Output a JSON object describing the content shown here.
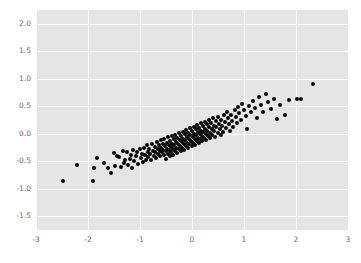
{
  "chart_data": {
    "type": "scatter",
    "title": "",
    "xlabel": "",
    "ylabel": "",
    "xlim": [
      -3,
      3
    ],
    "ylim": [
      -1.75,
      2.25
    ],
    "xticks": [
      -3,
      -2,
      -1,
      0,
      1,
      2,
      3
    ],
    "xticklabels": [
      "-3",
      "-2",
      "-1",
      "0",
      "1",
      "2",
      "3"
    ],
    "yticks": [
      2.0,
      1.5,
      1.0,
      0.5,
      0.0,
      -0.5,
      -1.0,
      -1.5
    ],
    "yticklabels": [
      "2.0",
      "1.5",
      "1.0",
      "0.5",
      "0.0",
      "-0.5",
      "-1.0",
      "-1.5"
    ],
    "grid": true,
    "grid_color": "#ffffff",
    "plot_background": "#e5e5e5",
    "figure_background": "#ffffff",
    "tick_label_color": "#6e6e6e",
    "marker_color": "#0a0a0a",
    "marker_size_px": 4,
    "legend": null,
    "n_points": 201,
    "points": [
      [
        -2.49,
        -0.86
      ],
      [
        -2.22,
        -0.57
      ],
      [
        -1.91,
        -0.86
      ],
      [
        -1.88,
        -0.62
      ],
      [
        -1.82,
        -0.44
      ],
      [
        -1.7,
        -0.54
      ],
      [
        -1.62,
        -0.62
      ],
      [
        -1.55,
        -0.72
      ],
      [
        -1.51,
        -0.35
      ],
      [
        -1.49,
        -0.58
      ],
      [
        -1.44,
        -0.41
      ],
      [
        -1.4,
        -0.43
      ],
      [
        -1.37,
        -0.6
      ],
      [
        -1.33,
        -0.31
      ],
      [
        -1.31,
        -0.53
      ],
      [
        -1.28,
        -0.48
      ],
      [
        -1.25,
        -0.34
      ],
      [
        -1.23,
        -0.57
      ],
      [
        -1.2,
        -0.45
      ],
      [
        -1.18,
        -0.38
      ],
      [
        -1.15,
        -0.62
      ],
      [
        -1.13,
        -0.3
      ],
      [
        -1.11,
        -0.5
      ],
      [
        -1.08,
        -0.41
      ],
      [
        -1.05,
        -0.33
      ],
      [
        -1.03,
        -0.55
      ],
      [
        -1.01,
        -0.28
      ],
      [
        -0.99,
        -0.44
      ],
      [
        -0.97,
        -0.36
      ],
      [
        -0.95,
        -0.52
      ],
      [
        -0.93,
        -0.25
      ],
      [
        -0.91,
        -0.39
      ],
      [
        -0.89,
        -0.47
      ],
      [
        -0.87,
        -0.21
      ],
      [
        -0.85,
        -0.34
      ],
      [
        -0.84,
        -0.43
      ],
      [
        -0.82,
        -0.27
      ],
      [
        -0.8,
        -0.36
      ],
      [
        -0.78,
        -0.48
      ],
      [
        -0.77,
        -0.18
      ],
      [
        -0.75,
        -0.31
      ],
      [
        -0.74,
        -0.4
      ],
      [
        -0.72,
        -0.24
      ],
      [
        -0.71,
        -0.34
      ],
      [
        -0.69,
        -0.44
      ],
      [
        -0.68,
        -0.15
      ],
      [
        -0.66,
        -0.28
      ],
      [
        -0.65,
        -0.37
      ],
      [
        -0.64,
        -0.21
      ],
      [
        -0.62,
        -0.31
      ],
      [
        -0.61,
        -0.41
      ],
      [
        -0.6,
        -0.12
      ],
      [
        -0.59,
        -0.25
      ],
      [
        -0.58,
        -0.34
      ],
      [
        -0.56,
        -0.19
      ],
      [
        -0.55,
        -0.29
      ],
      [
        -0.54,
        -0.38
      ],
      [
        -0.53,
        -0.09
      ],
      [
        -0.52,
        -0.22
      ],
      [
        -0.51,
        -0.32
      ],
      [
        -0.5,
        -0.45
      ],
      [
        -0.49,
        -0.16
      ],
      [
        -0.48,
        -0.27
      ],
      [
        -0.47,
        -0.36
      ],
      [
        -0.46,
        -0.06
      ],
      [
        -0.45,
        -0.2
      ],
      [
        -0.44,
        -0.3
      ],
      [
        -0.43,
        -0.41
      ],
      [
        -0.42,
        -0.13
      ],
      [
        -0.41,
        -0.24
      ],
      [
        -0.4,
        -0.33
      ],
      [
        -0.39,
        -0.04
      ],
      [
        -0.38,
        -0.18
      ],
      [
        -0.37,
        -0.28
      ],
      [
        -0.36,
        -0.38
      ],
      [
        -0.35,
        -0.1
      ],
      [
        -0.34,
        -0.21
      ],
      [
        -0.33,
        -0.31
      ],
      [
        -0.32,
        -0.02
      ],
      [
        -0.31,
        -0.15
      ],
      [
        -0.3,
        -0.25
      ],
      [
        -0.29,
        -0.35
      ],
      [
        -0.28,
        -0.07
      ],
      [
        -0.27,
        -0.18
      ],
      [
        -0.26,
        -0.28
      ],
      [
        -0.25,
        0.01
      ],
      [
        -0.24,
        -0.12
      ],
      [
        -0.23,
        -0.22
      ],
      [
        -0.22,
        -0.32
      ],
      [
        -0.21,
        -0.04
      ],
      [
        -0.2,
        -0.15
      ],
      [
        -0.19,
        -0.25
      ],
      [
        -0.18,
        0.04
      ],
      [
        -0.17,
        -0.09
      ],
      [
        -0.16,
        -0.19
      ],
      [
        -0.15,
        -0.29
      ],
      [
        -0.14,
        -0.01
      ],
      [
        -0.13,
        -0.12
      ],
      [
        -0.12,
        -0.22
      ],
      [
        -0.11,
        0.07
      ],
      [
        -0.1,
        -0.06
      ],
      [
        -0.09,
        -0.16
      ],
      [
        -0.08,
        -0.26
      ],
      [
        -0.07,
        0.02
      ],
      [
        -0.06,
        -0.09
      ],
      [
        -0.05,
        -0.19
      ],
      [
        -0.04,
        0.1
      ],
      [
        -0.03,
        -0.03
      ],
      [
        -0.02,
        -0.13
      ],
      [
        -0.01,
        -0.23
      ],
      [
        0.0,
        0.05
      ],
      [
        0.01,
        -0.06
      ],
      [
        0.02,
        -0.16
      ],
      [
        0.03,
        0.13
      ],
      [
        0.04,
        0.0
      ],
      [
        0.05,
        -0.1
      ],
      [
        0.06,
        -0.2
      ],
      [
        0.07,
        0.08
      ],
      [
        0.08,
        -0.03
      ],
      [
        0.09,
        -0.13
      ],
      [
        0.1,
        0.16
      ],
      [
        0.11,
        0.03
      ],
      [
        0.12,
        -0.07
      ],
      [
        0.13,
        -0.17
      ],
      [
        0.14,
        0.11
      ],
      [
        0.15,
        0.0
      ],
      [
        0.16,
        -0.1
      ],
      [
        0.17,
        0.19
      ],
      [
        0.18,
        0.06
      ],
      [
        0.19,
        -0.04
      ],
      [
        0.2,
        -0.14
      ],
      [
        0.21,
        0.14
      ],
      [
        0.22,
        0.03
      ],
      [
        0.23,
        -0.07
      ],
      [
        0.24,
        0.22
      ],
      [
        0.25,
        0.09
      ],
      [
        0.26,
        -0.01
      ],
      [
        0.27,
        -0.11
      ],
      [
        0.28,
        0.17
      ],
      [
        0.29,
        0.06
      ],
      [
        0.3,
        -0.04
      ],
      [
        0.32,
        0.25
      ],
      [
        0.33,
        0.12
      ],
      [
        0.34,
        0.02
      ],
      [
        0.35,
        -0.08
      ],
      [
        0.37,
        0.2
      ],
      [
        0.38,
        0.09
      ],
      [
        0.39,
        -0.02
      ],
      [
        0.41,
        0.28
      ],
      [
        0.42,
        0.15
      ],
      [
        0.43,
        0.05
      ],
      [
        0.45,
        -0.05
      ],
      [
        0.46,
        0.23
      ],
      [
        0.47,
        0.12
      ],
      [
        0.49,
        0.01
      ],
      [
        0.5,
        0.31
      ],
      [
        0.52,
        0.18
      ],
      [
        0.53,
        0.08
      ],
      [
        0.55,
        -0.02
      ],
      [
        0.56,
        0.26
      ],
      [
        0.58,
        0.15
      ],
      [
        0.6,
        0.04
      ],
      [
        0.62,
        0.34
      ],
      [
        0.63,
        0.21
      ],
      [
        0.65,
        0.11
      ],
      [
        0.67,
        0.4
      ],
      [
        0.69,
        0.28
      ],
      [
        0.71,
        0.17
      ],
      [
        0.73,
        0.06
      ],
      [
        0.75,
        0.35
      ],
      [
        0.77,
        0.24
      ],
      [
        0.79,
        0.13
      ],
      [
        0.82,
        0.43
      ],
      [
        0.84,
        0.31
      ],
      [
        0.86,
        0.2
      ],
      [
        0.89,
        0.48
      ],
      [
        0.91,
        0.37
      ],
      [
        0.94,
        0.26
      ],
      [
        0.97,
        0.55
      ],
      [
        1.0,
        0.43
      ],
      [
        1.03,
        0.32
      ],
      [
        1.06,
        0.09
      ],
      [
        1.09,
        0.5
      ],
      [
        1.13,
        0.39
      ],
      [
        1.17,
        0.6
      ],
      [
        1.21,
        0.47
      ],
      [
        1.25,
        0.28
      ],
      [
        1.29,
        0.66
      ],
      [
        1.33,
        0.52
      ],
      [
        1.37,
        0.4
      ],
      [
        1.42,
        0.73
      ],
      [
        1.46,
        0.58
      ],
      [
        1.51,
        0.45
      ],
      [
        1.57,
        0.64
      ],
      [
        1.63,
        0.27
      ],
      [
        1.7,
        0.52
      ],
      [
        1.78,
        0.34
      ],
      [
        1.86,
        0.62
      ],
      [
        2.02,
        0.63
      ],
      [
        2.09,
        0.63
      ],
      [
        2.33,
        0.91
      ]
    ]
  }
}
